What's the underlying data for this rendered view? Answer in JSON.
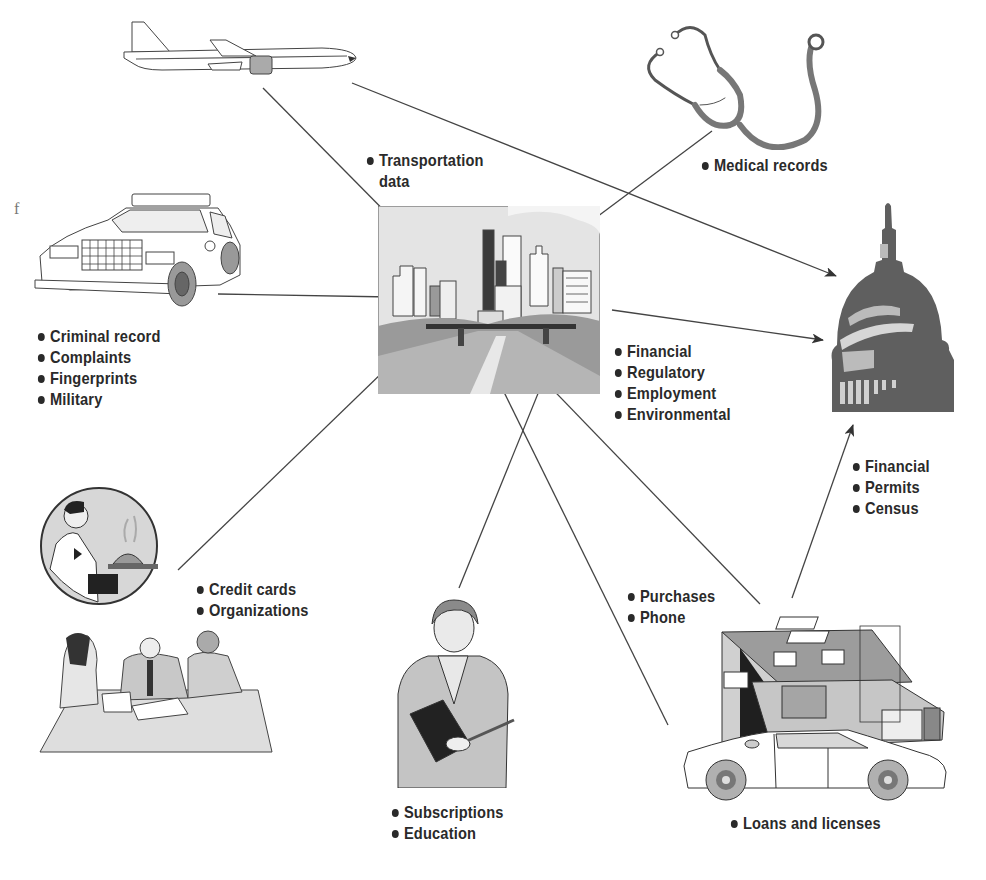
{
  "diagram": {
    "type": "flow-to-government",
    "hub": {
      "name": "city",
      "label_lines": [
        "Transportation",
        "data"
      ]
    },
    "sink": {
      "name": "capitol-dome"
    },
    "stray_char": "f",
    "groups": {
      "transportation": {
        "items": [
          "Transportation",
          "data"
        ]
      },
      "medical": {
        "items": [
          "Medical records"
        ]
      },
      "police": {
        "items": [
          "Criminal record",
          "Complaints",
          "Fingerprints",
          "Military"
        ]
      },
      "city_business": {
        "items": [
          "Financial",
          "Regulatory",
          "Employment",
          "Environmental"
        ]
      },
      "government": {
        "items": [
          "Financial",
          "Permits",
          "Census"
        ]
      },
      "credit": {
        "items": [
          "Credit cards",
          "Organizations"
        ]
      },
      "purchases": {
        "items": [
          "Purchases",
          "Phone"
        ]
      },
      "education": {
        "items": [
          "Subscriptions",
          "Education"
        ]
      },
      "loans": {
        "items": [
          "Loans and licenses"
        ]
      }
    },
    "colors": {
      "ink": "#2a2a2a",
      "line": "#444444",
      "dome": "#5f5f5f",
      "light_fill": "#d8d8d8",
      "mid_fill": "#a9a9a9",
      "dark_fill": "#1f1f1f"
    }
  }
}
